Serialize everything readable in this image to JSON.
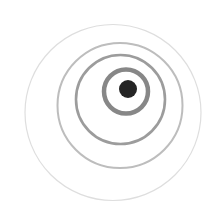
{
  "graphic": {
    "description": "Offset concentric rings with a dark center dot",
    "background": "#ffffff",
    "rings": [
      {
        "name": "outer-ring",
        "cx": 113,
        "cy": 112.5,
        "r": 88,
        "stroke": "#dedede",
        "width": 1.2
      },
      {
        "name": "third-ring",
        "cx": 120,
        "cy": 105.5,
        "r": 62.5,
        "stroke": "#bdbdbd",
        "width": 2
      },
      {
        "name": "second-ring",
        "cx": 120.5,
        "cy": 99.5,
        "r": 44.5,
        "stroke": "#9c9c9c",
        "width": 2.6
      },
      {
        "name": "inner-ring",
        "cx": 126,
        "cy": 91.5,
        "r": 22,
        "stroke": "#878787",
        "width": 4.5
      }
    ],
    "center_dot": {
      "cx": 128,
      "cy": 89,
      "r": 9,
      "fill": "#252525"
    }
  }
}
